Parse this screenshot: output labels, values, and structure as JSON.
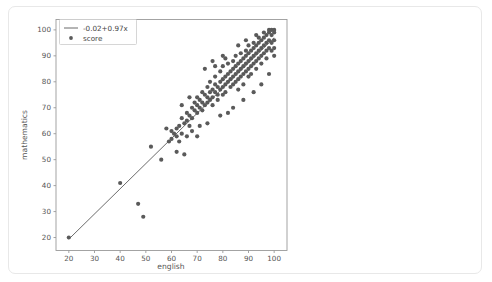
{
  "chart_data": {
    "type": "scatter",
    "title": "",
    "xlabel": "english",
    "ylabel": "mathematics",
    "xlim": [
      15,
      105
    ],
    "ylim": [
      15,
      104
    ],
    "xticks": [
      20,
      30,
      40,
      50,
      60,
      70,
      80,
      90,
      100
    ],
    "yticks": [
      20,
      30,
      40,
      50,
      60,
      70,
      80,
      90,
      100
    ],
    "grid": false,
    "legend_position": "upper-left",
    "point_color": "#5a5a5a",
    "line_color": "#5a5a5a",
    "series": [
      {
        "name": "score",
        "marker": "circle",
        "points": [
          [
            20,
            20
          ],
          [
            40,
            41
          ],
          [
            47,
            33
          ],
          [
            49,
            28
          ],
          [
            52,
            55
          ],
          [
            56,
            50
          ],
          [
            59,
            57
          ],
          [
            60,
            61
          ],
          [
            60,
            58
          ],
          [
            61,
            60
          ],
          [
            62,
            59
          ],
          [
            62,
            62
          ],
          [
            63,
            63
          ],
          [
            63,
            57
          ],
          [
            64,
            60
          ],
          [
            64,
            66
          ],
          [
            65,
            64
          ],
          [
            65,
            52
          ],
          [
            66,
            65
          ],
          [
            66,
            68
          ],
          [
            67,
            67
          ],
          [
            67,
            63
          ],
          [
            68,
            70
          ],
          [
            68,
            66
          ],
          [
            69,
            69
          ],
          [
            69,
            72
          ],
          [
            70,
            71
          ],
          [
            70,
            68
          ],
          [
            70,
            74
          ],
          [
            71,
            73
          ],
          [
            71,
            70
          ],
          [
            72,
            72
          ],
          [
            72,
            76
          ],
          [
            72,
            69
          ],
          [
            73,
            75
          ],
          [
            73,
            71
          ],
          [
            74,
            74
          ],
          [
            74,
            78
          ],
          [
            74,
            72
          ],
          [
            75,
            76
          ],
          [
            75,
            73
          ],
          [
            75,
            80
          ],
          [
            76,
            77
          ],
          [
            76,
            74
          ],
          [
            76,
            71
          ],
          [
            77,
            79
          ],
          [
            77,
            76
          ],
          [
            77,
            82
          ],
          [
            78,
            78
          ],
          [
            78,
            75
          ],
          [
            78,
            73
          ],
          [
            79,
            80
          ],
          [
            79,
            77
          ],
          [
            79,
            84
          ],
          [
            80,
            81
          ],
          [
            80,
            78
          ],
          [
            80,
            75
          ],
          [
            80,
            86
          ],
          [
            81,
            82
          ],
          [
            81,
            79
          ],
          [
            81,
            76
          ],
          [
            82,
            83
          ],
          [
            82,
            80
          ],
          [
            82,
            87
          ],
          [
            82,
            68
          ],
          [
            83,
            84
          ],
          [
            83,
            81
          ],
          [
            83,
            78
          ],
          [
            84,
            85
          ],
          [
            84,
            82
          ],
          [
            84,
            79
          ],
          [
            84,
            88
          ],
          [
            85,
            86
          ],
          [
            85,
            83
          ],
          [
            85,
            80
          ],
          [
            85,
            90
          ],
          [
            86,
            87
          ],
          [
            86,
            84
          ],
          [
            86,
            81
          ],
          [
            86,
            77
          ],
          [
            87,
            88
          ],
          [
            87,
            85
          ],
          [
            87,
            82
          ],
          [
            87,
            91
          ],
          [
            88,
            89
          ],
          [
            88,
            86
          ],
          [
            88,
            83
          ],
          [
            88,
            79
          ],
          [
            89,
            90
          ],
          [
            89,
            87
          ],
          [
            89,
            84
          ],
          [
            89,
            92
          ],
          [
            90,
            91
          ],
          [
            90,
            88
          ],
          [
            90,
            85
          ],
          [
            90,
            82
          ],
          [
            90,
            94
          ],
          [
            91,
            92
          ],
          [
            91,
            89
          ],
          [
            91,
            86
          ],
          [
            91,
            83
          ],
          [
            92,
            93
          ],
          [
            92,
            90
          ],
          [
            92,
            87
          ],
          [
            92,
            95
          ],
          [
            93,
            94
          ],
          [
            93,
            91
          ],
          [
            93,
            88
          ],
          [
            93,
            85
          ],
          [
            94,
            95
          ],
          [
            94,
            92
          ],
          [
            94,
            89
          ],
          [
            94,
            97
          ],
          [
            95,
            96
          ],
          [
            95,
            93
          ],
          [
            95,
            90
          ],
          [
            95,
            87
          ],
          [
            96,
            97
          ],
          [
            96,
            94
          ],
          [
            96,
            91
          ],
          [
            96,
            99
          ],
          [
            97,
            98
          ],
          [
            97,
            95
          ],
          [
            97,
            92
          ],
          [
            97,
            89
          ],
          [
            98,
            99
          ],
          [
            98,
            96
          ],
          [
            98,
            93
          ],
          [
            98,
            100
          ],
          [
            99,
            98
          ],
          [
            99,
            95
          ],
          [
            99,
            92
          ],
          [
            99,
            100
          ],
          [
            100,
            99
          ],
          [
            100,
            96
          ],
          [
            100,
            93
          ],
          [
            100,
            100
          ],
          [
            100,
            90
          ],
          [
            73,
            85
          ],
          [
            76,
            88
          ],
          [
            80,
            90
          ],
          [
            67,
            74
          ],
          [
            71,
            63
          ],
          [
            74,
            64
          ],
          [
            79,
            67
          ],
          [
            84,
            70
          ],
          [
            88,
            73
          ],
          [
            92,
            76
          ],
          [
            95,
            79
          ],
          [
            98,
            83
          ],
          [
            62,
            53
          ],
          [
            58,
            62
          ],
          [
            86,
            94
          ],
          [
            89,
            96
          ],
          [
            93,
            98
          ],
          [
            77,
            86
          ],
          [
            81,
            89
          ],
          [
            70,
            59
          ],
          [
            66,
            59
          ],
          [
            64,
            71
          ],
          [
            68,
            61
          ]
        ]
      }
    ],
    "fit_line": {
      "label": "-0.02+0.97x",
      "intercept": -0.02,
      "slope": 0.97,
      "x_start": 20,
      "x_end": 100
    }
  },
  "legend": {
    "entries": [
      {
        "label": "-0.02+0.97x",
        "type": "line"
      },
      {
        "label": "score",
        "type": "marker"
      }
    ]
  }
}
